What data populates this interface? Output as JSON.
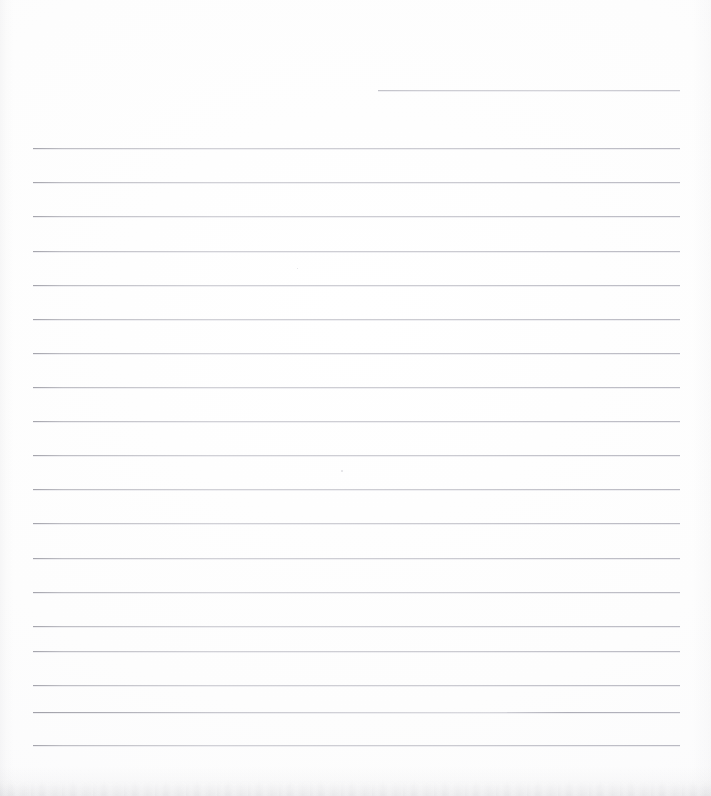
{
  "document": {
    "type": "scanned-lined-paper",
    "title": "",
    "visible_text": "",
    "orientation": "portrait",
    "page_width": 711,
    "page_height": 796,
    "background_color": "#fdfdfd",
    "rule_color": "#d6d6da",
    "rule_count": 18,
    "has_handwriting": false,
    "has_printed_text": false,
    "notes_label": "Blank ruled page — no text content present"
  },
  "rules": {
    "partial_top_rule": {
      "label": "partial-rule",
      "x": 378,
      "y": 90,
      "width": 302
    },
    "full_rules": [
      {
        "label": "rule-1",
        "x": 33,
        "y": 148,
        "width": 647
      },
      {
        "label": "rule-2",
        "x": 33,
        "y": 182,
        "width": 647
      },
      {
        "label": "rule-3",
        "x": 33,
        "y": 216,
        "width": 647
      },
      {
        "label": "rule-4",
        "x": 33,
        "y": 251,
        "width": 647
      },
      {
        "label": "rule-5",
        "x": 33,
        "y": 285,
        "width": 647
      },
      {
        "label": "rule-6",
        "x": 33,
        "y": 319,
        "width": 647
      },
      {
        "label": "rule-7",
        "x": 33,
        "y": 353,
        "width": 647
      },
      {
        "label": "rule-8",
        "x": 33,
        "y": 387,
        "width": 647
      },
      {
        "label": "rule-9",
        "x": 33,
        "y": 421,
        "width": 647
      },
      {
        "label": "rule-10",
        "x": 33,
        "y": 455,
        "width": 647
      },
      {
        "label": "rule-11",
        "x": 33,
        "y": 489,
        "width": 647
      },
      {
        "label": "rule-12",
        "x": 33,
        "y": 523,
        "width": 647
      },
      {
        "label": "rule-13",
        "x": 33,
        "y": 558,
        "width": 647
      },
      {
        "label": "rule-14",
        "x": 33,
        "y": 592,
        "width": 647
      },
      {
        "label": "rule-15",
        "x": 33,
        "y": 626,
        "width": 647
      },
      {
        "label": "rule-16",
        "x": 33,
        "y": 651,
        "width": 647
      },
      {
        "label": "rule-17",
        "x": 33,
        "y": 685,
        "width": 647
      },
      {
        "label": "rule-19",
        "x": 33,
        "y": 745,
        "width": 647
      }
    ],
    "broken_rule": {
      "label": "rule-18-broken",
      "y": 712,
      "left_x": 33,
      "left_width": 457,
      "right_x": 507,
      "right_width": 173,
      "gap_start": 490,
      "gap_end": 507
    }
  },
  "artifacts": {
    "left_edge_shadow": "vertical-scan-shadow",
    "right_edge_shadow": "vertical-scan-shadow",
    "bottom_edge_shadow": "mottled-page-edge-shadow",
    "specks": [
      {
        "x": 341,
        "y": 470,
        "size": 2
      },
      {
        "x": 297,
        "y": 268,
        "size": 1
      }
    ]
  }
}
